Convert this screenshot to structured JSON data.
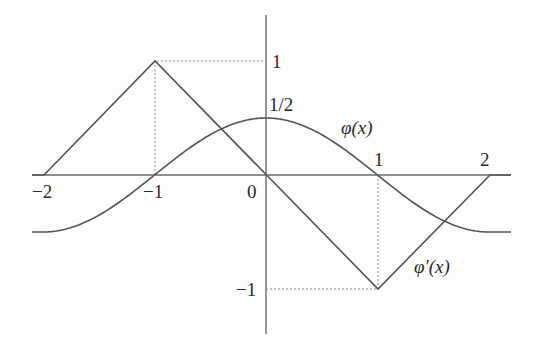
{
  "figure": {
    "labels": {
      "y_one": "1",
      "y_half": "1/2",
      "y_neg_one": "−1",
      "x_neg_two": "−2",
      "x_neg_one": "−1",
      "x_zero": "0",
      "x_one": "1",
      "x_two": "2",
      "phi": "φ(x)",
      "phi_prime": "φ′(x)"
    },
    "colors": {
      "curve": "#555555",
      "axis": "#6a6a6a",
      "guide": "#8a8a8a",
      "text": "#2a2a2a"
    }
  },
  "chart_data": {
    "type": "line",
    "title": "",
    "xlabel": "",
    "ylabel": "",
    "xlim": [
      -2.1,
      2.2
    ],
    "ylim": [
      -1.4,
      1.4
    ],
    "x_ticks": [
      "-2",
      "-1",
      "0",
      "1",
      "2"
    ],
    "y_ticks": [
      "1",
      "1/2",
      "-1"
    ],
    "grid": false,
    "series": [
      {
        "name": "φ(x)",
        "style": "smooth",
        "points": [
          [
            -2.1,
            -0.5
          ],
          [
            -2,
            -0.5
          ],
          [
            -1,
            0
          ],
          [
            0,
            0.5
          ],
          [
            1,
            0
          ],
          [
            2,
            -0.5
          ],
          [
            2.1,
            -0.5
          ]
        ]
      },
      {
        "name": "φ′(x)",
        "style": "piecewise-linear",
        "points": [
          [
            -2.1,
            0
          ],
          [
            -2,
            0
          ],
          [
            -1,
            1
          ],
          [
            0,
            0
          ],
          [
            1,
            -1
          ],
          [
            2,
            0
          ],
          [
            2.2,
            0
          ]
        ]
      }
    ],
    "guides": [
      {
        "from": [
          -1,
          0
        ],
        "to": [
          -1,
          1
        ],
        "style": "dotted"
      },
      {
        "from": [
          -1,
          1
        ],
        "to": [
          0,
          1
        ],
        "style": "dotted"
      },
      {
        "from": [
          1,
          0
        ],
        "to": [
          1,
          -1
        ],
        "style": "dotted"
      },
      {
        "from": [
          0,
          -1
        ],
        "to": [
          1,
          -1
        ],
        "style": "dotted"
      }
    ]
  }
}
